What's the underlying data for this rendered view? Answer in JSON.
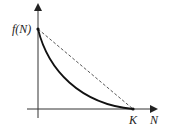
{
  "diagram": {
    "type": "function-graph",
    "labels": {
      "y_value": "f(N)",
      "x_point": "K",
      "x_axis": "N"
    },
    "curves": [
      {
        "name": "convex-decreasing-curve",
        "style": "solid",
        "from": "f(N)",
        "to": "K"
      },
      {
        "name": "secant-line",
        "style": "dashed",
        "from": "f(N)",
        "to": "K"
      }
    ],
    "colors": {
      "axis": "#333333",
      "curve": "#111111",
      "dashed": "#444444"
    }
  }
}
